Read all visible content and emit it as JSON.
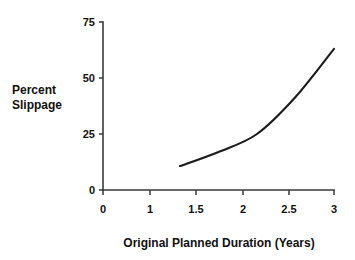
{
  "chart_data": {
    "type": "line",
    "title": "",
    "xlabel": "Original Planned Duration (Years)",
    "ylabel": "Percent Slippage",
    "ylabel_lines": [
      "Percent",
      "Slippage"
    ],
    "x": [
      1,
      1.5,
      2,
      2.5,
      3
    ],
    "values": [
      10.7,
      17,
      25,
      41.5,
      63
    ],
    "series": [
      {
        "name": "Percent Slippage",
        "values": [
          10.7,
          17,
          25,
          41.5,
          63
        ],
        "color": "#1b1b1b"
      }
    ],
    "xtick_labels": [
      "0",
      "1",
      "1.5",
      "2",
      "2.5",
      "3"
    ],
    "xtick_values": [
      0,
      1,
      1.5,
      2,
      2.5,
      3
    ],
    "ytick_labels": [
      "0",
      "25",
      "50",
      "75"
    ],
    "ytick_values": [
      0,
      25,
      50,
      75
    ],
    "xlim": [
      0,
      3
    ],
    "ylim": [
      0,
      75
    ],
    "grid": false,
    "legend": false,
    "legend_position": "none",
    "axis_color": "#3a3a3a",
    "background": "#ffffff"
  },
  "axis": {
    "x_tick_0": "0",
    "x_tick_1": "1",
    "x_tick_2": "1.5",
    "x_tick_3": "2",
    "x_tick_4": "2.5",
    "x_tick_5": "3",
    "y_tick_0": "0",
    "y_tick_1": "25",
    "y_tick_2": "50",
    "y_tick_3": "75"
  },
  "labels": {
    "x_title": "Original Planned Duration (Years)",
    "y_title_line1": "Percent",
    "y_title_line2": "Slippage"
  }
}
